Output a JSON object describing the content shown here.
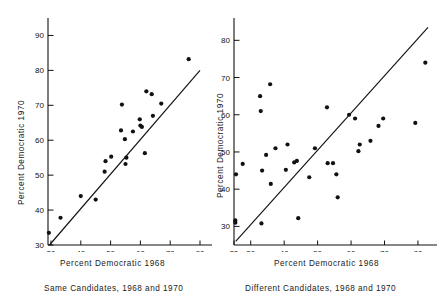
{
  "figure": {
    "title": "",
    "panels": [
      {
        "id": "same-candidates",
        "caption": "Same Candidates, 1968 and 1970",
        "xlabel": "Percent Democratic 1968",
        "ylabel": "Percent Democratic 1970",
        "xticks": [
          "30",
          "40",
          "50",
          "60",
          "70",
          "80"
        ],
        "yticks": [
          "30",
          "40",
          "50",
          "60",
          "70",
          "80",
          "90"
        ]
      },
      {
        "id": "different-candidates",
        "caption": "Different Candidates, 1968 and 1970",
        "xlabel": "Percent Democratic 1968",
        "ylabel": "Percent Democratic 1970",
        "xticks": [
          "25",
          "30",
          "40",
          "50",
          "60",
          "70",
          "80"
        ],
        "yticks": [
          "30",
          "40",
          "50",
          "60",
          "70",
          "80"
        ]
      }
    ]
  },
  "chart_data": [
    {
      "type": "scatter",
      "id": "same-candidates",
      "title": "Same Candidates, 1968 and 1970",
      "xlabel": "Percent Democratic 1968",
      "ylabel": "Percent Democratic 1970",
      "xlim": [
        29,
        80
      ],
      "ylim": [
        30,
        95
      ],
      "xticks": [
        30,
        40,
        50,
        60,
        70,
        80
      ],
      "yticks": [
        30,
        40,
        50,
        60,
        70,
        80,
        90
      ],
      "grid": false,
      "legend": null,
      "annotations": [
        "45-degree reference line y = x"
      ],
      "reference_line": {
        "type": "identity",
        "from": [
          29.5,
          30
        ],
        "to": [
          80,
          80
        ]
      },
      "points": [
        [
          29.3,
          33.5
        ],
        [
          33.2,
          37.8
        ],
        [
          40.0,
          44.0
        ],
        [
          45.0,
          43.0
        ],
        [
          48.0,
          51.0
        ],
        [
          48.3,
          54.0
        ],
        [
          50.2,
          55.3
        ],
        [
          53.5,
          62.8
        ],
        [
          53.8,
          70.2
        ],
        [
          54.8,
          60.3
        ],
        [
          55.0,
          53.2
        ],
        [
          55.3,
          55.0
        ],
        [
          57.5,
          62.5
        ],
        [
          59.8,
          66.0
        ],
        [
          60.0,
          64.2
        ],
        [
          60.5,
          63.8
        ],
        [
          61.5,
          56.3
        ],
        [
          62.0,
          74.0
        ],
        [
          63.8,
          73.2
        ],
        [
          64.2,
          67.0
        ],
        [
          67.0,
          70.5
        ],
        [
          76.2,
          83.2
        ]
      ]
    },
    {
      "type": "scatter",
      "id": "different-candidates",
      "title": "Different Candidates, 1968 and 1970",
      "xlabel": "Percent Democratic 1968",
      "ylabel": "Percent Democratic 1970",
      "xlim": [
        25,
        83
      ],
      "ylim": [
        25,
        86
      ],
      "xticks": [
        25,
        30,
        40,
        50,
        60,
        70,
        80
      ],
      "yticks": [
        30,
        40,
        50,
        60,
        70,
        80
      ],
      "grid": false,
      "legend": null,
      "annotations": [
        "45-degree reference line y = x"
      ],
      "reference_line": {
        "type": "identity",
        "from": [
          25.5,
          26
        ],
        "to": [
          83,
          83.5
        ]
      },
      "points": [
        [
          25.4,
          31.0
        ],
        [
          25.4,
          31.6
        ],
        [
          25.6,
          44.0
        ],
        [
          27.6,
          46.8
        ],
        [
          32.8,
          65.0
        ],
        [
          33.0,
          61.0
        ],
        [
          33.2,
          30.8
        ],
        [
          33.4,
          45.0
        ],
        [
          34.6,
          49.2
        ],
        [
          35.8,
          68.2
        ],
        [
          36.0,
          41.4
        ],
        [
          37.4,
          51.0
        ],
        [
          40.5,
          45.2
        ],
        [
          41.0,
          52.0
        ],
        [
          43.0,
          47.2
        ],
        [
          43.8,
          47.6
        ],
        [
          44.2,
          32.2
        ],
        [
          47.5,
          43.2
        ],
        [
          49.2,
          51.0
        ],
        [
          52.8,
          62.0
        ],
        [
          53.0,
          47.0
        ],
        [
          54.6,
          47.0
        ],
        [
          55.6,
          44.0
        ],
        [
          56.0,
          37.8
        ],
        [
          59.4,
          60.0
        ],
        [
          61.2,
          59.0
        ],
        [
          62.2,
          50.2
        ],
        [
          62.6,
          52.0
        ],
        [
          65.8,
          53.0
        ],
        [
          68.2,
          57.0
        ],
        [
          69.6,
          59.0
        ],
        [
          79.2,
          57.8
        ],
        [
          82.2,
          74.0
        ]
      ]
    }
  ]
}
